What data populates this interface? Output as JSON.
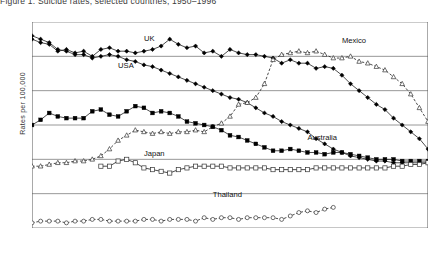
{
  "caption": "Figure 1.  Suicide rates, selected countries, 1950–1996",
  "axes": {
    "ylabel": "Rates per 100,000",
    "yticks": [
      0,
      2,
      4,
      6,
      8,
      10,
      12
    ],
    "ylim": [
      0,
      12
    ],
    "xlim": [
      1950,
      1996
    ],
    "xticks": [
      1950,
      1951,
      1952,
      1953,
      1954,
      1955,
      1956,
      1957,
      1958,
      1959,
      1960,
      1961,
      1962,
      1963,
      1964,
      1965,
      1966,
      1967,
      1968,
      1969,
      1970,
      1971,
      1972,
      1973,
      1974,
      1975,
      1976,
      1977,
      1978,
      1979,
      1980,
      1981,
      1982,
      1983,
      1984,
      1985,
      1986,
      1987,
      1988,
      1989,
      1990,
      1991,
      1992,
      1993,
      1994,
      1995,
      1996
    ],
    "xticklabels": [
      "1950",
      "1952",
      "1954",
      "1956",
      "1958",
      "1960",
      "1962",
      "1964",
      "1966",
      "1968",
      "1970",
      "1972",
      "1974",
      "1976",
      "1978",
      "1980",
      "1982",
      "1984",
      "1986",
      "1988",
      "1990",
      "1992",
      "1994",
      "1996"
    ]
  },
  "chart_data": {
    "type": "line",
    "title": "Suicide rates, selected countries, 1950–1996",
    "xlabel": "",
    "ylabel": "Rates per 100,000",
    "ylim": [
      0,
      12
    ],
    "xlim": [
      1950,
      1996
    ],
    "grid": "horizontal",
    "legend": "inline-labels",
    "x": [
      1950,
      1951,
      1952,
      1953,
      1954,
      1955,
      1956,
      1957,
      1958,
      1959,
      1960,
      1961,
      1962,
      1963,
      1964,
      1965,
      1966,
      1967,
      1968,
      1969,
      1970,
      1971,
      1972,
      1973,
      1974,
      1975,
      1976,
      1977,
      1978,
      1979,
      1980,
      1981,
      1982,
      1983,
      1984,
      1985,
      1986,
      1987,
      1988,
      1989,
      1990,
      1991,
      1992,
      1993,
      1994,
      1995,
      1996
    ],
    "series": [
      {
        "name": "UK",
        "marker": "filled-diamond",
        "linestyle": "solid",
        "label_x": 1963,
        "label_y": 10.9,
        "values": [
          11.0,
          10.8,
          10.7,
          10.3,
          10.4,
          10.2,
          10.3,
          10.0,
          10.4,
          10.5,
          10.3,
          10.3,
          10.2,
          10.3,
          10.4,
          10.6,
          11.0,
          10.7,
          10.5,
          10.6,
          10.2,
          10.3,
          10.0,
          10.4,
          10.2,
          10.1,
          10.1,
          10.0,
          9.9,
          9.6,
          9.8,
          9.6,
          9.6,
          9.3,
          9.4,
          9.3,
          8.9,
          8.4,
          8.0,
          7.6,
          7.2,
          6.9,
          6.4,
          6.0,
          5.6,
          5.2,
          4.6
        ]
      },
      {
        "name": "USA",
        "marker": "filled-diamond",
        "linestyle": "solid",
        "label_x": 1960,
        "label_y": 9.3,
        "values": [
          11.2,
          11.0,
          10.8,
          10.4,
          10.3,
          10.1,
          10.1,
          9.9,
          10.0,
          10.1,
          10.0,
          9.8,
          9.7,
          9.5,
          9.4,
          9.2,
          9.0,
          8.8,
          8.6,
          8.4,
          8.2,
          8.0,
          7.8,
          7.6,
          7.5,
          7.3,
          7.0,
          6.7,
          6.5,
          6.2,
          6.0,
          5.8,
          5.6,
          5.2,
          4.9,
          4.6,
          4.4,
          4.2,
          4.1,
          4.0,
          3.9,
          3.9,
          3.8,
          3.8,
          3.8,
          3.8,
          3.8
        ]
      },
      {
        "name": "Mexico",
        "marker": "open-triangle",
        "linestyle": "dashed",
        "label_x": 1986,
        "label_y": 10.8,
        "values": [
          3.6,
          3.6,
          3.7,
          3.8,
          3.8,
          3.9,
          3.9,
          4.0,
          4.2,
          4.6,
          5.1,
          5.4,
          5.7,
          5.6,
          5.5,
          5.6,
          5.5,
          5.6,
          5.6,
          5.7,
          5.6,
          5.9,
          6.1,
          6.5,
          7.2,
          7.3,
          7.6,
          8.4,
          9.8,
          10.1,
          10.2,
          10.3,
          10.2,
          10.3,
          10.1,
          9.9,
          9.9,
          10.0,
          9.7,
          9.6,
          9.4,
          9.2,
          8.8,
          8.4,
          7.8,
          7.0,
          6.2
        ]
      },
      {
        "name": "Australia",
        "marker": "filled-square",
        "linestyle": "solid",
        "label_x": 1982,
        "label_y": 5.1,
        "values": [
          6.0,
          6.3,
          6.7,
          6.5,
          6.4,
          6.4,
          6.4,
          6.8,
          6.9,
          6.6,
          6.5,
          6.8,
          7.1,
          7.0,
          6.7,
          6.8,
          6.7,
          6.5,
          6.2,
          6.1,
          6.0,
          5.9,
          5.7,
          5.4,
          5.3,
          5.1,
          4.9,
          4.7,
          4.5,
          4.5,
          4.6,
          4.5,
          4.4,
          4.4,
          4.3,
          4.4,
          4.4,
          4.3,
          4.2,
          4.1,
          4.0,
          4.0,
          4.0,
          3.9,
          3.9,
          3.9,
          3.9
        ]
      },
      {
        "name": "Japan",
        "marker": "open-square",
        "linestyle": "solid",
        "label_x": 1963,
        "label_y": 4.2,
        "values": [
          null,
          null,
          null,
          null,
          null,
          null,
          null,
          null,
          3.6,
          3.6,
          3.9,
          4.0,
          3.8,
          3.5,
          3.4,
          3.3,
          3.2,
          3.4,
          3.5,
          3.6,
          3.6,
          3.6,
          3.6,
          3.5,
          3.5,
          3.5,
          3.5,
          3.5,
          3.4,
          3.4,
          3.4,
          3.4,
          3.4,
          3.5,
          3.5,
          3.5,
          3.5,
          3.5,
          3.5,
          3.5,
          3.5,
          3.5,
          3.6,
          3.6,
          3.7,
          3.7,
          3.8
        ]
      },
      {
        "name": "Thailand",
        "marker": "open-circle",
        "linestyle": "dashed",
        "label_x": 1971,
        "label_y": 1.8,
        "values": [
          0.3,
          0.4,
          0.4,
          0.4,
          0.3,
          0.4,
          0.4,
          0.5,
          0.5,
          0.4,
          0.4,
          0.4,
          0.4,
          0.5,
          0.5,
          0.4,
          0.5,
          0.5,
          0.5,
          0.4,
          0.6,
          0.5,
          0.6,
          0.6,
          0.5,
          0.6,
          0.6,
          0.6,
          0.6,
          0.5,
          0.7,
          0.9,
          1.0,
          0.9,
          1.1,
          1.2,
          null,
          null,
          null,
          null,
          null,
          null,
          null,
          null,
          null,
          null,
          null
        ]
      }
    ]
  }
}
